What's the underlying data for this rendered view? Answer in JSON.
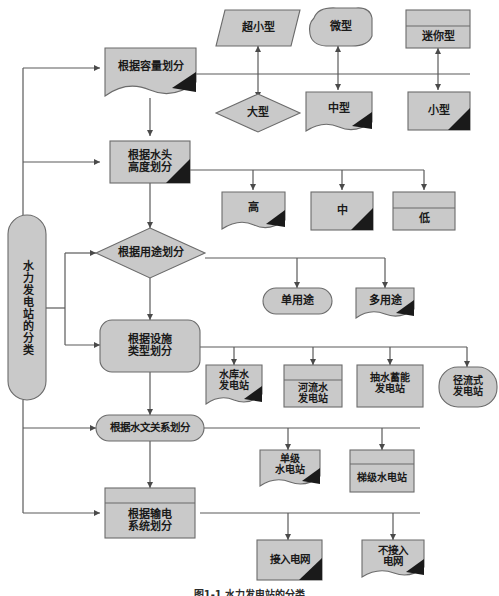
{
  "figure": {
    "caption": "图1-1  水力发电站的分类",
    "root_label": "水力发电站的分类"
  },
  "colors": {
    "shape_fill": "#c9c9c9",
    "shape_stroke": "#6b6b6b",
    "corner_marker": "#1a1a1a",
    "connector": "#5a5a5a",
    "text": "#1a1a1a",
    "page_background": "#ffffff"
  },
  "criteria": [
    {
      "id": "capacity",
      "label": "根据容量划分",
      "shape": "document-wave"
    },
    {
      "id": "head",
      "label": "根据水头\n高度划分",
      "shape": "rect-corner"
    },
    {
      "id": "purpose",
      "label": "根据用途划分",
      "shape": "diamond"
    },
    {
      "id": "facility",
      "label": "根据设施\n类型划分",
      "shape": "rounded-rect"
    },
    {
      "id": "hydrology",
      "label": "根据水文关系划分",
      "shape": "stadium"
    },
    {
      "id": "transmission",
      "label": "根据输电\n系统划分",
      "shape": "rect-header"
    }
  ],
  "outcomes": {
    "capacity_upper": [
      {
        "label": "超小型",
        "shape": "parallelogram"
      },
      {
        "label": "微型",
        "shape": "blob"
      },
      {
        "label": "迷你型",
        "shape": "rect-header"
      }
    ],
    "capacity_lower": [
      {
        "label": "大型",
        "shape": "diamond"
      },
      {
        "label": "中型",
        "shape": "document-wave"
      },
      {
        "label": "小型",
        "shape": "rect-corner"
      }
    ],
    "head": [
      {
        "label": "高",
        "shape": "document-wave"
      },
      {
        "label": "中",
        "shape": "rect-corner"
      },
      {
        "label": "低",
        "shape": "rect-header"
      }
    ],
    "purpose": [
      {
        "label": "单用途",
        "shape": "stadium"
      },
      {
        "label": "多用途",
        "shape": "document-wave"
      }
    ],
    "facility": [
      {
        "label": "水库水\n发电站",
        "shape": "document-wave"
      },
      {
        "label": "河流水\n发电站",
        "shape": "rect-header"
      },
      {
        "label": "抽水蓄能\n发电站",
        "shape": "rect-corner"
      },
      {
        "label": "径流式\n发电站",
        "shape": "stadium"
      }
    ],
    "hydrology": [
      {
        "label": "单级\n水电站",
        "shape": "document-wave"
      },
      {
        "label": "梯级水电站",
        "shape": "rect-header"
      }
    ],
    "transmission": [
      {
        "label": "接入电网",
        "shape": "rect-corner"
      },
      {
        "label": "不接入\n电网",
        "shape": "document-wave"
      }
    ]
  }
}
